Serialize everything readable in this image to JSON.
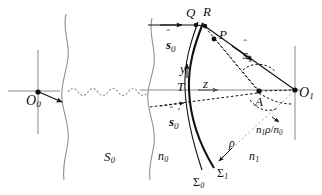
{
  "figure": {
    "type": "optics-ray-diagram",
    "width": 322,
    "height": 195,
    "background": "#ffffff",
    "ink": "#111111",
    "axis_color": "#8a8a8a"
  },
  "points": {
    "O0": {
      "label": "O",
      "sub": "0",
      "x": 36,
      "y": 92
    },
    "O1": {
      "label": "O",
      "sub": "1",
      "x": 295,
      "y": 90
    },
    "Q": {
      "label": "Q",
      "sub": "",
      "x": 190,
      "y": 22
    },
    "R": {
      "label": "R",
      "sub": "",
      "x": 207,
      "y": 21
    },
    "P": {
      "label": "P",
      "sub": "",
      "x": 216,
      "y": 38
    },
    "T": {
      "label": "T",
      "sub": "",
      "x": 190,
      "y": 88
    },
    "A": {
      "label": "A",
      "sub": "",
      "x": 259,
      "y": 92
    }
  },
  "axes": {
    "y_axis_label": "y",
    "z_axis_label": "z"
  },
  "media": {
    "n0_label": "n",
    "n0_sub": "0",
    "n1_label": "n",
    "n1_sub": "1"
  },
  "surfaces": {
    "S0": {
      "label": "S",
      "sub": "0"
    },
    "Sigma0": {
      "label": "Σ",
      "sub": "0"
    },
    "Sigma1": {
      "label": "Σ",
      "sub": "1"
    }
  },
  "vectors": {
    "s0_hat": {
      "hat": "ˆ",
      "sym": "s",
      "sub": "0",
      "prime": ""
    },
    "s0_prime_hat": {
      "hat": "ˆ",
      "sym": "s",
      "sub": "0",
      "prime": "′"
    },
    "s1_hat": {
      "hat": "ˆ",
      "sym": "s",
      "sub": "1",
      "prime": ""
    }
  },
  "distances": {
    "rho": "ρ",
    "scaled_rho_numer": "n",
    "scaled_rho_numer_sub": "1",
    "scaled_rho_rho": "ρ",
    "scaled_rho_slash": "/",
    "scaled_rho_denom": "n",
    "scaled_rho_denom_sub": "0",
    "scaled_rho_full": "n1ρ/n0"
  }
}
